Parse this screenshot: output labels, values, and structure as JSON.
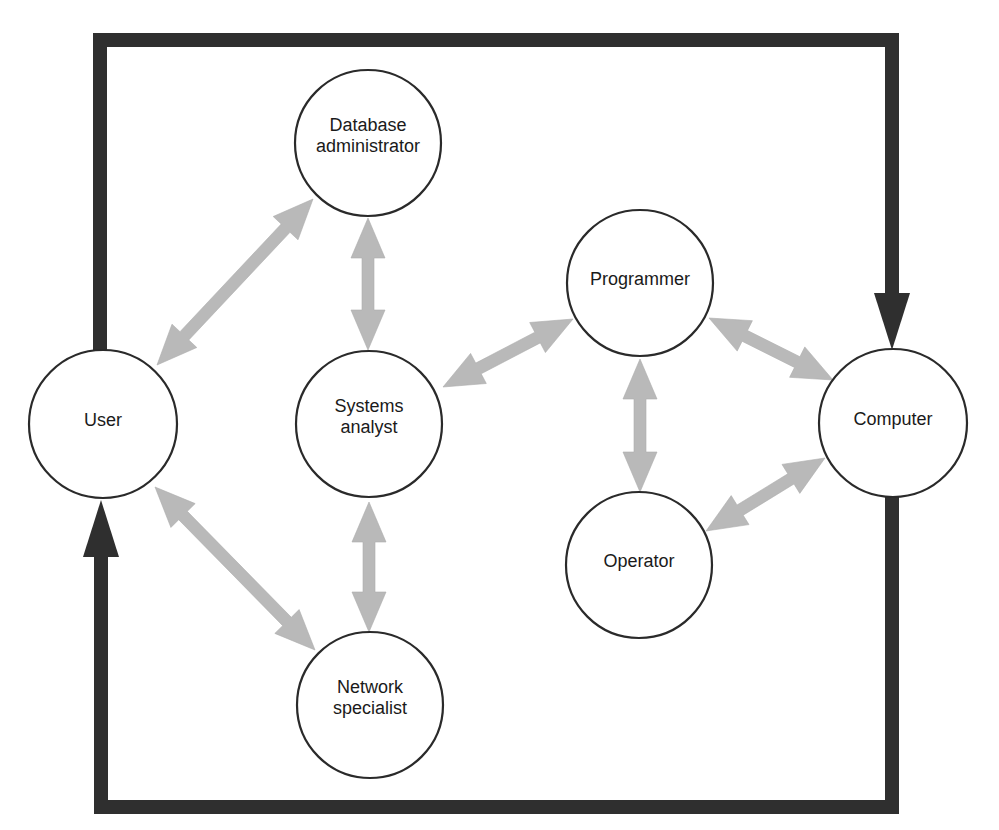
{
  "diagram": {
    "title": "",
    "frame": {
      "color": "#2f2f2f",
      "thickness": 14,
      "top_path": [
        [
          100,
          355
        ],
        [
          100,
          40
        ],
        [
          892,
          40
        ],
        [
          892,
          293
        ]
      ],
      "bottom_path": [
        [
          892,
          496
        ],
        [
          892,
          807
        ],
        [
          101,
          807
        ],
        [
          101,
          557
        ]
      ],
      "arrowheads": [
        {
          "id": "into-computer",
          "direction": "down",
          "tip": [
            892,
            350
          ],
          "base_y": 293,
          "half_width": 18
        },
        {
          "id": "into-user",
          "direction": "up",
          "tip": [
            101,
            500
          ],
          "base_y": 557,
          "half_width": 18
        }
      ]
    },
    "nodes": [
      {
        "id": "user",
        "label_lines": [
          "User"
        ],
        "cx": 103,
        "cy": 424,
        "r": 74
      },
      {
        "id": "database-administrator",
        "label_lines": [
          "Database",
          "administrator"
        ],
        "cx": 368,
        "cy": 143,
        "r": 73
      },
      {
        "id": "systems-analyst",
        "label_lines": [
          "Systems",
          "analyst"
        ],
        "cx": 369,
        "cy": 424,
        "r": 73
      },
      {
        "id": "network-specialist",
        "label_lines": [
          "Network",
          "specialist"
        ],
        "cx": 370,
        "cy": 705,
        "r": 73
      },
      {
        "id": "programmer",
        "label_lines": [
          "Programmer"
        ],
        "cx": 640,
        "cy": 283,
        "r": 73
      },
      {
        "id": "operator",
        "label_lines": [
          "Operator"
        ],
        "cx": 639,
        "cy": 565,
        "r": 73
      },
      {
        "id": "computer",
        "label_lines": [
          "Computer"
        ],
        "cx": 893,
        "cy": 423,
        "r": 74
      }
    ],
    "links": [
      {
        "from": "user",
        "to": "database-administrator",
        "p1": [
          157,
          365
        ],
        "p2": [
          313,
          199
        ],
        "bidirectional": true
      },
      {
        "from": "database-administrator",
        "to": "systems-analyst",
        "p1": [
          368,
          218
        ],
        "p2": [
          368,
          350
        ],
        "bidirectional": true
      },
      {
        "from": "systems-analyst",
        "to": "programmer",
        "p1": [
          443,
          387
        ],
        "p2": [
          573,
          319
        ],
        "bidirectional": true
      },
      {
        "from": "programmer",
        "to": "computer",
        "p1": [
          709,
          318
        ],
        "p2": [
          833,
          380
        ],
        "bidirectional": true
      },
      {
        "from": "operator",
        "to": "computer",
        "p1": [
          706,
          531
        ],
        "p2": [
          825,
          458
        ],
        "bidirectional": true
      },
      {
        "from": "programmer",
        "to": "operator",
        "p1": [
          640,
          359
        ],
        "p2": [
          640,
          492
        ],
        "bidirectional": true
      },
      {
        "from": "user",
        "to": "network-specialist",
        "p1": [
          155,
          487
        ],
        "p2": [
          315,
          650
        ],
        "bidirectional": true
      },
      {
        "from": "systems-analyst",
        "to": "network-specialist",
        "p1": [
          369,
          502
        ],
        "p2": [
          369,
          632
        ],
        "bidirectional": true
      }
    ],
    "colors": {
      "frame": "#2f2f2f",
      "link_fill": "#b9b9b9",
      "node_stroke": "#2a2a2a",
      "background": "#ffffff"
    }
  }
}
